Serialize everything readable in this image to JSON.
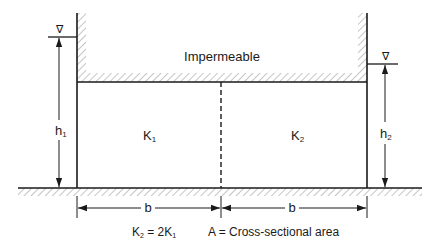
{
  "diagram": {
    "title_label": "Impermeable",
    "left_soil_label": "K",
    "left_soil_sub": "1",
    "right_soil_label": "K",
    "right_soil_sub": "2",
    "left_head_label": "h",
    "left_head_sub": "1",
    "right_head_label": "h",
    "right_head_sub": "2",
    "left_width_label": "b",
    "right_width_label": "b",
    "water_level_symbol": "∇",
    "relation": {
      "lhs_k": "K",
      "lhs_sub": "2",
      "eq": " = 2K",
      "rhs_sub": "1"
    },
    "legend_text": "A = Cross-sectional area"
  },
  "colors": {
    "line": "#1a1a1a",
    "hatch": "#9a9a9a",
    "background": "#ffffff"
  }
}
